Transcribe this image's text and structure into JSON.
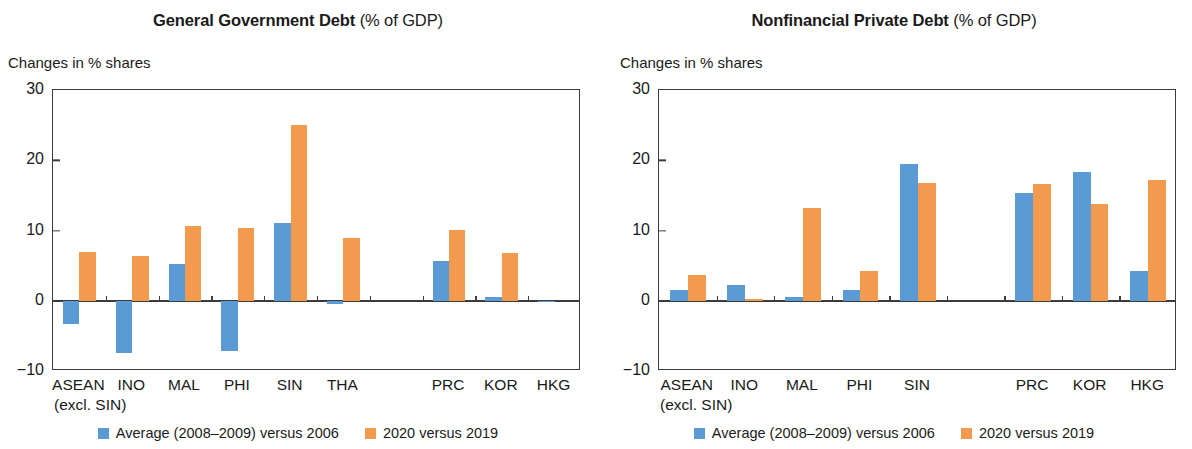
{
  "colors": {
    "blue": "#5b9bd5",
    "orange": "#f29a4d",
    "axis": "#3b3b3b"
  },
  "legend": {
    "blue_label": "Average (2008–2009) versus 2006",
    "orange_label": "2020 versus 2019"
  },
  "panels": [
    {
      "title_main": "General Government Debt",
      "title_sub": "(% of GDP)",
      "axis_caption": "Changes in % shares",
      "sublabel": "(excl. SIN)"
    },
    {
      "title_main": "Nonfinancial Private Debt",
      "title_sub": "(% of GDP)",
      "axis_caption": "Changes in % shares",
      "sublabel": "(excl. SIN)"
    }
  ],
  "chart_data": [
    {
      "type": "bar",
      "title": "General Government Debt (% of GDP)",
      "xlabel": "",
      "ylabel": "Changes in % shares",
      "ylim": [
        -10,
        30
      ],
      "yticks": [
        30,
        20,
        10,
        0,
        -10
      ],
      "ytick_labels": [
        "30",
        "20",
        "10",
        "0",
        "−10"
      ],
      "grid": false,
      "legend_position": "bottom",
      "categories": [
        "ASEAN",
        "INO",
        "MAL",
        "PHI",
        "SIN",
        "THA",
        "",
        "PRC",
        "KOR",
        "HKG"
      ],
      "category_notes": [
        "(excl. SIN)",
        "",
        "",
        "",
        "",
        "",
        "",
        "",
        "",
        ""
      ],
      "spacer_index": 6,
      "series": [
        {
          "name": "Average (2008–2009) versus 2006",
          "color": "#5b9bd5",
          "values": [
            -3.3,
            -7.4,
            5.3,
            -7.2,
            11.0,
            -0.4,
            null,
            5.6,
            0.5,
            -0.2
          ]
        },
        {
          "name": "2020 versus 2019",
          "color": "#f29a4d",
          "values": [
            7.0,
            6.3,
            10.6,
            10.3,
            25.0,
            8.9,
            null,
            10.1,
            6.8,
            0.0
          ]
        }
      ]
    },
    {
      "type": "bar",
      "title": "Nonfinancial Private Debt (% of GDP)",
      "xlabel": "",
      "ylabel": "Changes in % shares",
      "ylim": [
        -10,
        30
      ],
      "yticks": [
        30,
        20,
        10,
        0,
        -10
      ],
      "ytick_labels": [
        "30",
        "20",
        "10",
        "0",
        "−10"
      ],
      "grid": false,
      "legend_position": "bottom",
      "categories": [
        "ASEAN",
        "INO",
        "MAL",
        "PHI",
        "SIN",
        "",
        "PRC",
        "KOR",
        "HKG"
      ],
      "category_notes": [
        "(excl. SIN)",
        "",
        "",
        "",
        "",
        "",
        "",
        "",
        ""
      ],
      "spacer_index": 5,
      "series": [
        {
          "name": "Average (2008–2009) versus 2006",
          "color": "#5b9bd5",
          "values": [
            1.6,
            2.2,
            0.6,
            1.5,
            19.4,
            null,
            15.3,
            18.3,
            4.3
          ]
        },
        {
          "name": "2020 versus 2019",
          "color": "#f29a4d",
          "values": [
            3.6,
            0.2,
            13.2,
            4.3,
            16.8,
            null,
            16.6,
            13.8,
            17.2
          ]
        }
      ]
    }
  ]
}
